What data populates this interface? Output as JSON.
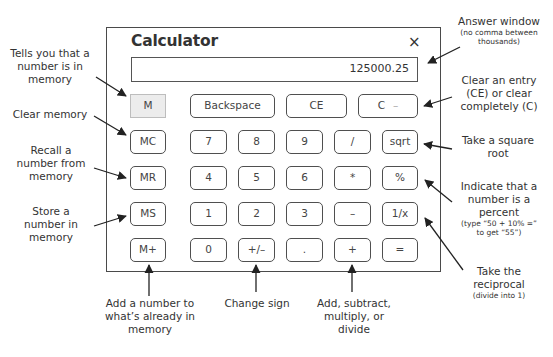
{
  "calculator": {
    "title": "Calculator",
    "close_icon": "×",
    "display_value": "125000.25",
    "memory_indicator": "M",
    "top_row": [
      "Backspace",
      "CE",
      "C"
    ],
    "memory_buttons": [
      "MC",
      "MR",
      "MS",
      "M+"
    ],
    "keypad": [
      [
        "7",
        "8",
        "9",
        "/",
        "sqrt"
      ],
      [
        "4",
        "5",
        "6",
        "*",
        "%"
      ],
      [
        "1",
        "2",
        "3",
        "–",
        "1/x"
      ],
      [
        "0",
        "+/–",
        ".",
        "+",
        "="
      ]
    ]
  },
  "annotations": {
    "memory_indicator": [
      "Tells you that a",
      "number is in",
      "memory"
    ],
    "clear_memory": [
      "Clear memory"
    ],
    "recall_memory": [
      "Recall a",
      "number from",
      "memory"
    ],
    "store_memory": [
      "Store a",
      "number in",
      "memory"
    ],
    "add_memory": [
      "Add a number to",
      "what’s already in",
      "memory"
    ],
    "change_sign": [
      "Change sign"
    ],
    "arithmetic": [
      "Add, subtract,",
      "multiply, or",
      "divide"
    ],
    "answer_window": {
      "title": "Answer window",
      "note": [
        "(no comma between",
        "thousands)"
      ]
    },
    "clear_entry": [
      "Clear an entry",
      "(CE) or clear",
      "completely (C)"
    ],
    "square_root": [
      "Take a square",
      "root"
    ],
    "percent": {
      "lines": [
        "Indicate that a",
        "number is a",
        "percent"
      ],
      "note": [
        "(type “50 + 10% =”",
        "to get “55”)"
      ]
    },
    "reciprocal": {
      "lines": [
        "Take the",
        "reciprocal"
      ],
      "note": [
        "(divide into 1)"
      ]
    }
  }
}
